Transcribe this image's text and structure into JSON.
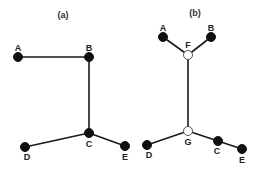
{
  "panels": [
    {
      "title": "(a)",
      "title_pos": [
        63,
        18
      ],
      "nodes": [
        {
          "id": "A",
          "label": "A",
          "x": 18,
          "y": 57,
          "type": "filled",
          "label_dx": 0,
          "label_dy": -6
        },
        {
          "id": "B",
          "label": "B",
          "x": 89,
          "y": 57,
          "type": "filled",
          "label_dx": 0,
          "label_dy": -6
        },
        {
          "id": "C",
          "label": "C",
          "x": 89,
          "y": 133,
          "type": "filled",
          "label_dx": 0,
          "label_dy": 14
        },
        {
          "id": "D",
          "label": "D",
          "x": 25,
          "y": 147,
          "type": "filled",
          "label_dx": 2,
          "label_dy": 13
        },
        {
          "id": "E",
          "label": "E",
          "x": 125,
          "y": 146,
          "type": "filled",
          "label_dx": 0,
          "label_dy": 14
        }
      ],
      "edges": [
        [
          "A",
          "B"
        ],
        [
          "B",
          "C"
        ],
        [
          "C",
          "D"
        ],
        [
          "C",
          "E"
        ]
      ]
    },
    {
      "title": "(b)",
      "title_pos": [
        195,
        16
      ],
      "nodes": [
        {
          "id": "A",
          "label": "A",
          "x": 163,
          "y": 37,
          "type": "filled",
          "label_dx": 0,
          "label_dy": -6
        },
        {
          "id": "B",
          "label": "B",
          "x": 211,
          "y": 37,
          "type": "filled",
          "label_dx": 0,
          "label_dy": -6
        },
        {
          "id": "F",
          "label": "F",
          "x": 188,
          "y": 55,
          "type": "hollow",
          "label_dx": 0,
          "label_dy": -7
        },
        {
          "id": "G",
          "label": "G",
          "x": 188,
          "y": 131,
          "type": "hollow",
          "label_dx": 0,
          "label_dy": 14
        },
        {
          "id": "D",
          "label": "D",
          "x": 147,
          "y": 145,
          "type": "filled",
          "label_dx": 2,
          "label_dy": 13
        },
        {
          "id": "C",
          "label": "C",
          "x": 218,
          "y": 141,
          "type": "filled",
          "label_dx": -1,
          "label_dy": 13
        },
        {
          "id": "E",
          "label": "E",
          "x": 242,
          "y": 149,
          "type": "filled",
          "label_dx": 0,
          "label_dy": 14
        }
      ],
      "edges": [
        [
          "A",
          "F"
        ],
        [
          "B",
          "F"
        ],
        [
          "F",
          "G"
        ],
        [
          "G",
          "D"
        ],
        [
          "G",
          "C"
        ],
        [
          "C",
          "E"
        ]
      ]
    }
  ],
  "style": {
    "node_radius": 4.5,
    "edge_color": "#1a1a1a",
    "node_fill": "#111111",
    "hollow_fill": "#ffffff"
  }
}
